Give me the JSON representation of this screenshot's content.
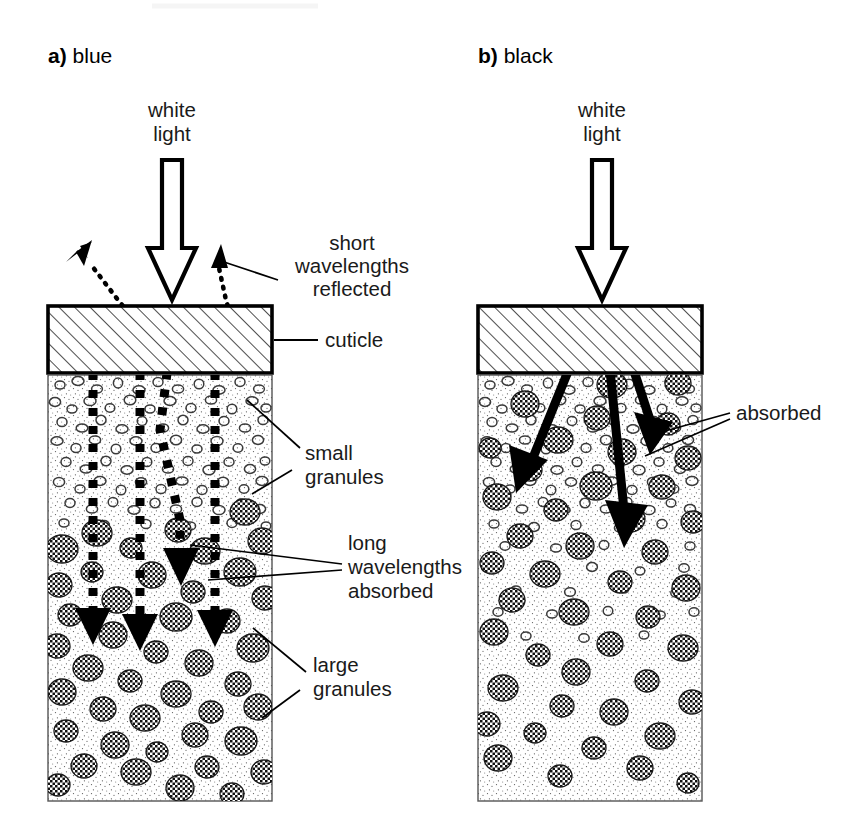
{
  "figure": {
    "type": "scientific-diagram",
    "background_color": "#ffffff",
    "ink_color": "#000000"
  },
  "panels": [
    {
      "id": "a",
      "marker": "a)",
      "title": "blue",
      "source_label_line1": "white",
      "source_label_line2": "light",
      "labels": {
        "reflected_line1": "short",
        "reflected_line2": "wavelengths",
        "reflected_line3": "reflected",
        "cuticle": "cuticle",
        "small_granules_line1": "small",
        "small_granules_line2": "granules",
        "absorbed_line1": "long",
        "absorbed_line2": "wavelengths",
        "absorbed_line3": "absorbed",
        "large_granules_line1": "large",
        "large_granules_line2": "granules"
      },
      "layers": [
        {
          "name": "cuticle",
          "fill_pattern": "diagonal-hatch"
        },
        {
          "name": "small-granule-layer",
          "fill_pattern": "stipple-with-open-granules"
        },
        {
          "name": "large-granule-layer",
          "fill_pattern": "stipple-with-checkered-granules"
        }
      ],
      "ray_style": "dotted-square-downward-arrows",
      "ray_count": 4,
      "reflected_ray_count": 2
    },
    {
      "id": "b",
      "marker": "b)",
      "title": "black",
      "source_label_line1": "white",
      "source_label_line2": "light",
      "labels": {
        "absorbed": "absorbed"
      },
      "layers": [
        {
          "name": "cuticle",
          "fill_pattern": "diagonal-hatch"
        },
        {
          "name": "granule-layer",
          "fill_pattern": "stipple-with-checkered-granules"
        }
      ],
      "ray_style": "thick-solid-downward-arrows",
      "ray_count": 3,
      "reflected_ray_count": 0
    }
  ],
  "colors": {
    "ink": "#000000",
    "hatch": "#2b2b2b",
    "stipple": "#555555",
    "granule_outline": "#333333",
    "paper": "#ffffff"
  }
}
